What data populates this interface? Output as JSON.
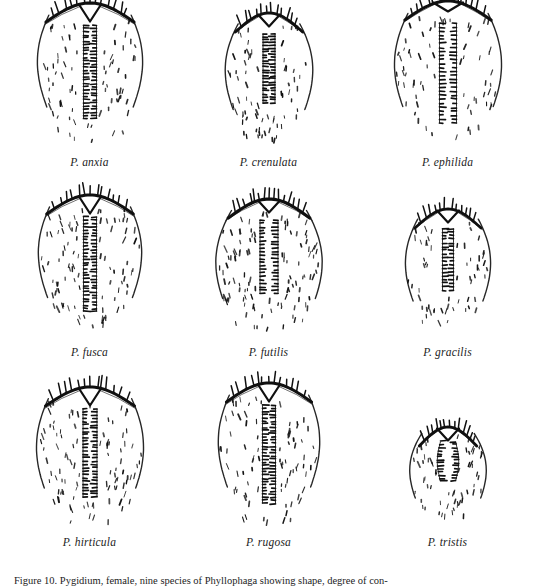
{
  "figure": {
    "background_color": "#ffffff",
    "ink_color": "#101010",
    "caption_number": "Figure 10.",
    "caption_text": "Figure 10.  Pygidium, female, nine species of Phyllophaga showing shape, degree of con-",
    "columns": 3,
    "rows": 3
  },
  "specimens": [
    {
      "id": "p-anxia",
      "label": "P. anxia",
      "row": 1,
      "column": 1,
      "width": 112,
      "height": 148,
      "outline": "tall-parallel-sided",
      "apex_notch": "deep-v",
      "groove": "long-narrow",
      "groove_length": 0.82,
      "groove_width": 13,
      "setae_density": "moderate",
      "setae_count": 74,
      "bristle_rows": 2,
      "bristles_per_row": 30,
      "arc_thickness": 3.1,
      "arc_spines": 13,
      "seed": 101
    },
    {
      "id": "p-crenulata",
      "label": "P. crenulata",
      "row": 1,
      "column": 2,
      "width": 100,
      "height": 138,
      "outline": "ovate-tapering",
      "apex_notch": "shallow-v",
      "groove": "medium-narrow",
      "groove_length": 0.66,
      "groove_width": 12,
      "setae_density": "moderate",
      "setae_count": 70,
      "bristle_rows": 2,
      "bristles_per_row": 24,
      "arc_thickness": 2.9,
      "arc_spines": 12,
      "seed": 202
    },
    {
      "id": "p-ephilida",
      "label": "P. ephilida",
      "row": 1,
      "column": 3,
      "width": 114,
      "height": 150,
      "outline": "broad-rounded",
      "apex_notch": "broad-shallow",
      "groove": "long-wide",
      "groove_length": 0.86,
      "groove_width": 17,
      "setae_density": "sparse",
      "setae_count": 66,
      "bristle_rows": 2,
      "bristles_per_row": 26,
      "arc_thickness": 3.0,
      "arc_spines": 14,
      "seed": 303
    },
    {
      "id": "p-fusca",
      "label": "P. fusca",
      "row": 2,
      "column": 1,
      "width": 110,
      "height": 146,
      "outline": "tall-parallel-sided",
      "apex_notch": "deep-v",
      "groove": "long-narrow",
      "groove_length": 0.84,
      "groove_width": 13,
      "setae_density": "dense",
      "setae_count": 92,
      "bristle_rows": 2,
      "bristles_per_row": 30,
      "arc_thickness": 3.0,
      "arc_spines": 13,
      "seed": 404
    },
    {
      "id": "p-futilis",
      "label": "P. futilis",
      "row": 2,
      "column": 2,
      "width": 118,
      "height": 142,
      "outline": "broad-globose",
      "apex_notch": "shallow-v",
      "groove": "medium-wide",
      "groove_length": 0.68,
      "groove_width": 18,
      "setae_density": "very-dense",
      "setae_count": 110,
      "bristle_rows": 2,
      "bristles_per_row": 22,
      "arc_thickness": 3.2,
      "arc_spines": 15,
      "seed": 505
    },
    {
      "id": "p-gracilis",
      "label": "P. gracilis",
      "row": 2,
      "column": 3,
      "width": 96,
      "height": 132,
      "outline": "narrow-ovate",
      "apex_notch": "shallow-v",
      "groove": "short-narrow",
      "groove_length": 0.62,
      "groove_width": 11,
      "setae_density": "sparse",
      "setae_count": 58,
      "bristle_rows": 2,
      "bristles_per_row": 18,
      "arc_thickness": 2.8,
      "arc_spines": 12,
      "seed": 606
    },
    {
      "id": "p-hirticula",
      "label": "P. hirticula",
      "row": 3,
      "column": 1,
      "width": 112,
      "height": 144,
      "outline": "tall-rounded",
      "apex_notch": "deep-v",
      "groove": "long-narrow",
      "groove_length": 0.8,
      "groove_width": 14,
      "setae_density": "dense",
      "setae_count": 96,
      "bristle_rows": 2,
      "bristles_per_row": 28,
      "arc_thickness": 3.0,
      "arc_spines": 13,
      "seed": 707
    },
    {
      "id": "p-rugosa",
      "label": "P. rugosa",
      "row": 3,
      "column": 2,
      "width": 108,
      "height": 148,
      "outline": "tall-parallel-sided",
      "apex_notch": "deep-v",
      "groove": "long-narrow",
      "groove_length": 0.86,
      "groove_width": 13,
      "setae_density": "moderate",
      "setae_count": 80,
      "bristle_rows": 2,
      "bristles_per_row": 32,
      "arc_thickness": 3.0,
      "arc_spines": 13,
      "seed": 808
    },
    {
      "id": "p-tristis",
      "label": "P. tristis",
      "row": 3,
      "column": 3,
      "width": 92,
      "height": 104,
      "outline": "small-transverse",
      "apex_notch": "shallow-v",
      "groove": "short-oval",
      "groove_length": 0.52,
      "groove_width": 15,
      "setae_density": "moderate",
      "setae_count": 58,
      "bristle_rows": 2,
      "bristles_per_row": 14,
      "arc_thickness": 2.9,
      "arc_spines": 12,
      "seed": 909
    }
  ]
}
